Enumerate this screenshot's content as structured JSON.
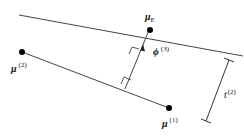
{
  "diagram": {
    "labels": {
      "mu_E": {
        "base": "μ",
        "sub": "E"
      },
      "phi3": {
        "base": "ϕ",
        "sup": "(3)"
      },
      "mu1": {
        "base": "μ",
        "sup": "(1)"
      },
      "mu2": {
        "base": "μ",
        "sup": "(2)"
      },
      "t2": {
        "base": "t",
        "sup": "(2)"
      }
    },
    "colors": {
      "line": "#444444",
      "dot": "#000000"
    }
  }
}
